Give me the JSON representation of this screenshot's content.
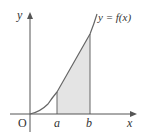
{
  "figure": {
    "curve_label": "y = f(x)",
    "axis_y_label": "y",
    "axis_x_label": "x",
    "origin_label": "O",
    "bound_a_label": "a",
    "bound_b_label": "b"
  },
  "colors": {
    "axis": "#555555",
    "curve": "#666666",
    "shade": "#e4e4e4",
    "text": "#333333"
  }
}
